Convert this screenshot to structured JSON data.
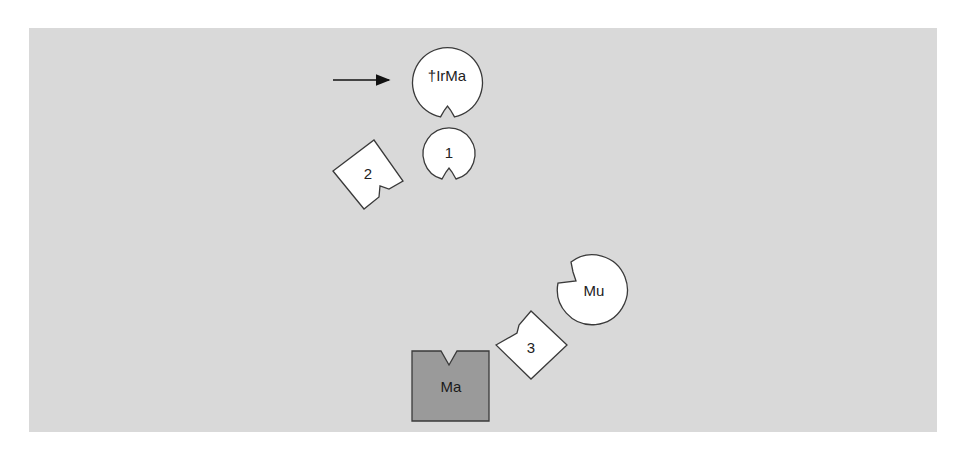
{
  "diagram": {
    "background_color": "#d9d9d9",
    "nodes": [
      {
        "id": "trma",
        "label": "†IrMa",
        "shape": "circle-with-notch-bottom",
        "fill": "#ffffff"
      },
      {
        "id": "one",
        "label": "1",
        "shape": "circle-with-notch-bottom",
        "fill": "#ffffff"
      },
      {
        "id": "two",
        "label": "2",
        "shape": "rotated-square-with-notch",
        "fill": "#ffffff"
      },
      {
        "id": "mu",
        "label": "Mu",
        "shape": "circle-with-notch-upper-left",
        "fill": "#ffffff"
      },
      {
        "id": "three",
        "label": "3",
        "shape": "rotated-square-with-notch",
        "fill": "#ffffff"
      },
      {
        "id": "ma",
        "label": "Ma",
        "shape": "square-with-notch-top",
        "fill": "#9a9a9a"
      }
    ],
    "arrow": {
      "points_to": "trma",
      "direction": "right"
    }
  }
}
